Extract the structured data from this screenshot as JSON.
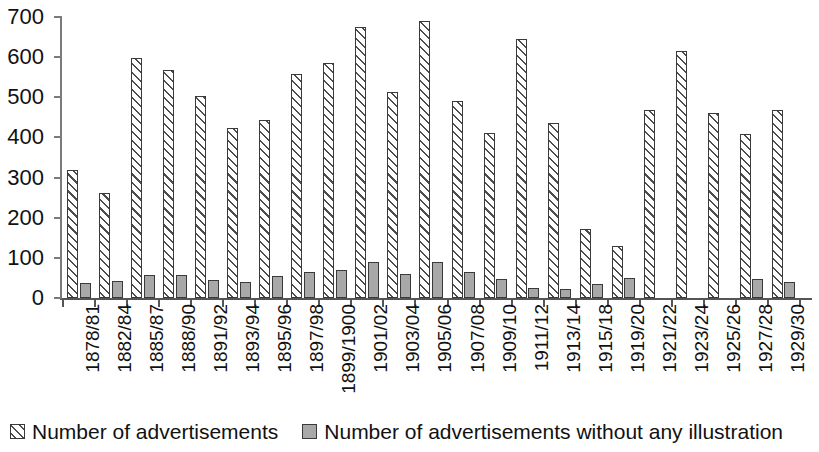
{
  "chart_data": {
    "type": "bar",
    "title": "",
    "subtitle": "",
    "xlabel": "",
    "ylabel": "",
    "ylim": [
      0,
      700
    ],
    "yticks": [
      0,
      100,
      200,
      300,
      400,
      500,
      600,
      700
    ],
    "ytick_labels": [
      "0",
      "100",
      "200",
      "300",
      "400",
      "500",
      "600",
      "700"
    ],
    "grid": false,
    "legend_position": "bottom-left",
    "categories": [
      "1878/81",
      "1882/84",
      "1885/87",
      "1888/90",
      "1891/92",
      "1893/94",
      "1895/96",
      "1897/98",
      "1899/1900",
      "1901/02",
      "1903/04",
      "1905/06",
      "1907/08",
      "1909/10",
      "1911/12",
      "1913/14",
      "1915/18",
      "1919/20",
      "1921/22",
      "1923/24",
      "1925/26",
      "1927/28",
      "1929/30"
    ],
    "series": [
      {
        "name": "Number of advertisements",
        "pattern": "diagonal-hatch",
        "color": "#ffffff",
        "edge_color": "#3a3a3a",
        "values": [
          318,
          262,
          597,
          568,
          503,
          423,
          443,
          558,
          585,
          675,
          512,
          690,
          490,
          410,
          645,
          437,
          172,
          130,
          468,
          615,
          462,
          408,
          468
        ]
      },
      {
        "name": "Number of advertisements without any illustration",
        "pattern": "solid",
        "color": "#a8a8a8",
        "edge_color": "#3a3a3a",
        "values": [
          37,
          42,
          58,
          58,
          45,
          41,
          55,
          66,
          70,
          90,
          60,
          90,
          66,
          48,
          25,
          23,
          36,
          50,
          0,
          0,
          0,
          47,
          40
        ]
      }
    ]
  },
  "legend": {
    "entries": [
      {
        "label": "Number of advertisements",
        "swatch": "hatched-swatch-icon"
      },
      {
        "label": "Number of advertisements without any illustration",
        "swatch": "solid-swatch-icon"
      }
    ]
  }
}
